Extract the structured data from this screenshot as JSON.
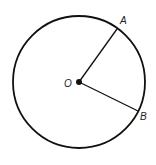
{
  "diagram": {
    "type": "circle-with-radii",
    "center": {
      "label": "O",
      "x": 79,
      "y": 82
    },
    "radius": 66,
    "points": [
      {
        "label": "A",
        "x": 117,
        "y": 29
      },
      {
        "label": "B",
        "x": 138,
        "y": 111
      }
    ],
    "segments": [
      {
        "from": "O",
        "to": "A"
      },
      {
        "from": "O",
        "to": "B"
      }
    ],
    "colors": {
      "stroke": "#111111",
      "background": "#ffffff"
    }
  }
}
